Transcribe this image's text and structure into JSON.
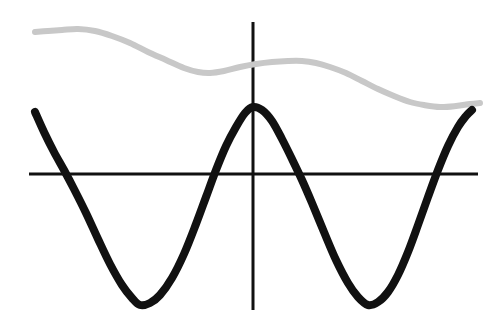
{
  "figure": {
    "title": "",
    "background_color": "#ffffff",
    "width": 501,
    "height": 325
  },
  "chart_data": {
    "type": "line",
    "title": "",
    "subtitle": "",
    "xlabel": "",
    "ylabel": "",
    "grid": false,
    "legend_position": "none",
    "tick_labels": {
      "x": [],
      "y": []
    },
    "annotations": [],
    "axes": {
      "x_axis": {
        "name": "horizontal-axis",
        "color": "#111111",
        "thickness": 3,
        "y_pixel": 174,
        "x_start_pixel": 29,
        "x_end_pixel": 478
      },
      "y_axis": {
        "name": "vertical-axis",
        "color": "#111111",
        "thickness": 3,
        "x_pixel": 253,
        "y_start_pixel": 22,
        "y_end_pixel": 310
      },
      "origin_pixel": [
        253,
        174
      ],
      "xlim": [
        -1.92,
        0.96
      ],
      "ylim": [
        -1.4,
        1.0
      ]
    },
    "series": [
      {
        "name": "damped-gray-wave",
        "label": "gray curve",
        "color": "#c8c8c8",
        "stroke_width": 6,
        "style": "solid",
        "zorder": 1,
        "points_pixel": [
          [
            35,
            32
          ],
          [
            48,
            31
          ],
          [
            62,
            30
          ],
          [
            78,
            29
          ],
          [
            95,
            31
          ],
          [
            112,
            36
          ],
          [
            130,
            43
          ],
          [
            148,
            52
          ],
          [
            166,
            60
          ],
          [
            184,
            68
          ],
          [
            198,
            72
          ],
          [
            210,
            73
          ],
          [
            224,
            71
          ],
          [
            240,
            67
          ],
          [
            256,
            64
          ],
          [
            272,
            62
          ],
          [
            288,
            61
          ],
          [
            302,
            61
          ],
          [
            316,
            63
          ],
          [
            330,
            67
          ],
          [
            346,
            73
          ],
          [
            362,
            81
          ],
          [
            378,
            89
          ],
          [
            394,
            96
          ],
          [
            410,
            102
          ],
          [
            424,
            105
          ],
          [
            440,
            107
          ],
          [
            456,
            106
          ],
          [
            470,
            104
          ],
          [
            480,
            103
          ]
        ]
      },
      {
        "name": "black-cosine-wave",
        "label": "black curve",
        "color": "#111111",
        "stroke_width": 8,
        "style": "solid",
        "zorder": 2,
        "points_pixel": [
          [
            35,
            112
          ],
          [
            44,
            132
          ],
          [
            54,
            152
          ],
          [
            64,
            170
          ],
          [
            74,
            189
          ],
          [
            86,
            213
          ],
          [
            98,
            239
          ],
          [
            110,
            264
          ],
          [
            122,
            285
          ],
          [
            132,
            298
          ],
          [
            140,
            305
          ],
          [
            150,
            303
          ],
          [
            160,
            295
          ],
          [
            172,
            278
          ],
          [
            184,
            254
          ],
          [
            196,
            224
          ],
          [
            206,
            197
          ],
          [
            216,
            170
          ],
          [
            226,
            146
          ],
          [
            236,
            127
          ],
          [
            245,
            113
          ],
          [
            253,
            107
          ],
          [
            262,
            110
          ],
          [
            272,
            121
          ],
          [
            282,
            139
          ],
          [
            292,
            159
          ],
          [
            302,
            180
          ],
          [
            312,
            203
          ],
          [
            324,
            232
          ],
          [
            336,
            260
          ],
          [
            348,
            283
          ],
          [
            358,
            297
          ],
          [
            368,
            305
          ],
          [
            378,
            302
          ],
          [
            388,
            292
          ],
          [
            398,
            275
          ],
          [
            408,
            252
          ],
          [
            418,
            225
          ],
          [
            428,
            197
          ],
          [
            438,
            170
          ],
          [
            448,
            146
          ],
          [
            458,
            127
          ],
          [
            466,
            116
          ],
          [
            472,
            110
          ]
        ]
      }
    ]
  }
}
